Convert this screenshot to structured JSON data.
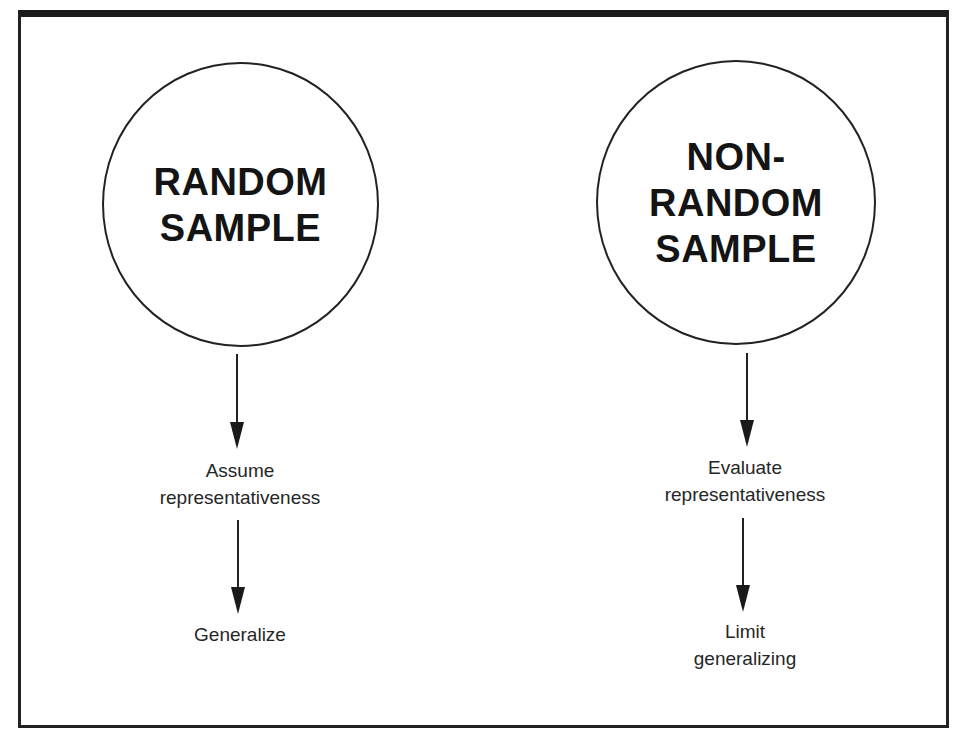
{
  "diagram": {
    "left_branch": {
      "title_lines": [
        "RANDOM",
        "SAMPLE"
      ],
      "step1_lines": [
        "Assume",
        "representativeness"
      ],
      "step2_lines": [
        "Generalize"
      ]
    },
    "right_branch": {
      "title_lines": [
        "NON-",
        "RANDOM",
        "SAMPLE"
      ],
      "step1_lines": [
        "Evaluate",
        "representativeness"
      ],
      "step2_lines": [
        "Limit",
        "generalizing"
      ]
    },
    "colors": {
      "line": "#222222",
      "text": "#1a1a1a",
      "background": "#ffffff"
    }
  }
}
